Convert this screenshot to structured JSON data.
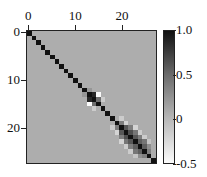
{
  "chart_data": {
    "type": "heatmap",
    "title": "",
    "xlabel": "",
    "ylabel": "",
    "size": 28,
    "x_ticks": [
      0,
      10,
      20
    ],
    "y_ticks": [
      0,
      10,
      20
    ],
    "x_tick_labels": [
      "0",
      "10",
      "20"
    ],
    "y_tick_labels": [
      "0",
      "10",
      "20"
    ],
    "colorbar": {
      "range": [
        -0.5,
        1.0
      ],
      "ticks": [
        1.0,
        0.5,
        0,
        -0.5
      ],
      "tick_labels": [
        "1.0",
        "0.5",
        "0",
        "-0.5"
      ],
      "colormap": "gray_r"
    },
    "background_value": 0,
    "diagonal_value": 1.0,
    "off_diagonal_entries": [
      {
        "i": 13,
        "j": 14,
        "v": 0.85
      },
      {
        "i": 14,
        "j": 13,
        "v": 0.85
      },
      {
        "i": 13,
        "j": 15,
        "v": -0.5
      },
      {
        "i": 15,
        "j": 13,
        "v": -0.5
      },
      {
        "i": 14,
        "j": 15,
        "v": 0.4
      },
      {
        "i": 15,
        "j": 14,
        "v": 0.4
      },
      {
        "i": 12,
        "j": 13,
        "v": 0.15
      },
      {
        "i": 13,
        "j": 12,
        "v": 0.15
      },
      {
        "i": 14,
        "j": 16,
        "v": -0.2
      },
      {
        "i": 16,
        "j": 14,
        "v": -0.2
      },
      {
        "i": 19,
        "j": 20,
        "v": 0.3
      },
      {
        "i": 20,
        "j": 19,
        "v": 0.3
      },
      {
        "i": 20,
        "j": 21,
        "v": 0.55
      },
      {
        "i": 21,
        "j": 20,
        "v": 0.55
      },
      {
        "i": 21,
        "j": 22,
        "v": 0.6
      },
      {
        "i": 22,
        "j": 21,
        "v": 0.6
      },
      {
        "i": 22,
        "j": 23,
        "v": 0.55
      },
      {
        "i": 23,
        "j": 22,
        "v": 0.55
      },
      {
        "i": 23,
        "j": 24,
        "v": 0.5
      },
      {
        "i": 24,
        "j": 23,
        "v": 0.5
      },
      {
        "i": 24,
        "j": 25,
        "v": 0.5
      },
      {
        "i": 25,
        "j": 24,
        "v": 0.5
      },
      {
        "i": 25,
        "j": 26,
        "v": 0.3
      },
      {
        "i": 26,
        "j": 25,
        "v": 0.3
      },
      {
        "i": 20,
        "j": 22,
        "v": 0.3
      },
      {
        "i": 22,
        "j": 20,
        "v": 0.3
      },
      {
        "i": 21,
        "j": 23,
        "v": 0.35
      },
      {
        "i": 23,
        "j": 21,
        "v": 0.35
      },
      {
        "i": 22,
        "j": 24,
        "v": 0.3
      },
      {
        "i": 24,
        "j": 22,
        "v": 0.3
      },
      {
        "i": 23,
        "j": 25,
        "v": 0.35
      },
      {
        "i": 25,
        "j": 23,
        "v": 0.35
      },
      {
        "i": 24,
        "j": 26,
        "v": 0.2
      },
      {
        "i": 26,
        "j": 24,
        "v": 0.2
      },
      {
        "i": 18,
        "j": 20,
        "v": -0.2
      },
      {
        "i": 20,
        "j": 18,
        "v": -0.2
      },
      {
        "i": 19,
        "j": 21,
        "v": -0.25
      },
      {
        "i": 21,
        "j": 19,
        "v": -0.25
      },
      {
        "i": 20,
        "j": 23,
        "v": -0.25
      },
      {
        "i": 23,
        "j": 20,
        "v": -0.25
      },
      {
        "i": 21,
        "j": 24,
        "v": -0.2
      },
      {
        "i": 24,
        "j": 21,
        "v": -0.2
      },
      {
        "i": 22,
        "j": 25,
        "v": -0.2
      },
      {
        "i": 25,
        "j": 22,
        "v": -0.2
      },
      {
        "i": 23,
        "j": 26,
        "v": -0.15
      },
      {
        "i": 26,
        "j": 23,
        "v": -0.15
      }
    ],
    "grid": false,
    "legend": "colorbar right"
  }
}
